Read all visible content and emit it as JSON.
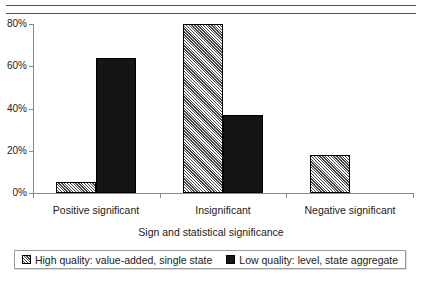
{
  "chart_data": {
    "type": "bar",
    "title": "",
    "xlabel": "Sign and statistical significance",
    "ylabel": "",
    "categories": [
      "Positive significant",
      "Insignificant",
      "Negative significant"
    ],
    "series": [
      {
        "name": "High quality: value-added, single state",
        "pattern": "hatched",
        "color": "#b8b8b8",
        "values": [
          5,
          80,
          18
        ]
      },
      {
        "name": "Low quality: level, state aggregate",
        "pattern": "solid",
        "color": "#151515",
        "values": [
          64,
          37,
          0
        ]
      }
    ],
    "ylim": [
      0,
      80
    ],
    "yticks": [
      0,
      20,
      40,
      60,
      80
    ],
    "ytick_labels": [
      "0%",
      "20%",
      "40%",
      "60%",
      "80%"
    ],
    "grid": false,
    "legend_position": "bottom"
  },
  "legend": {
    "entries": [
      {
        "label": "High quality: value-added, single state",
        "swatch": "hatched-swatch"
      },
      {
        "label": "Low quality: level, state aggregate",
        "swatch": "solid-swatch"
      }
    ]
  }
}
